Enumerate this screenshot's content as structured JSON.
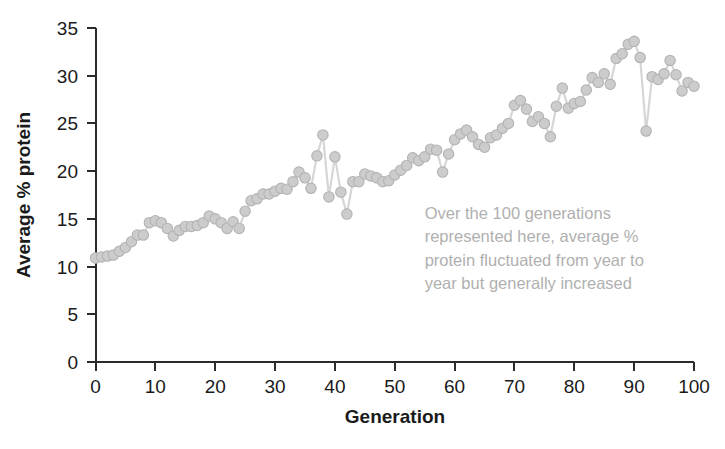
{
  "chart_data": {
    "type": "scatter",
    "title": "",
    "xlabel": "Generation",
    "ylabel": "Average % protein",
    "xlim": [
      0,
      100
    ],
    "ylim": [
      0,
      35
    ],
    "xticks": [
      0,
      10,
      20,
      30,
      40,
      50,
      60,
      70,
      80,
      90,
      100
    ],
    "yticks": [
      0,
      5,
      10,
      15,
      20,
      25,
      30,
      35
    ],
    "grid": false,
    "legend": null,
    "marker_style": "filled-circle-gray-connected-by-line",
    "annotations": [
      {
        "text": "Over the 100 generations represented here, average % protein fluctuated from year to year but generally increased",
        "lines": [
          "Over the 100 generations",
          "represented here, average %",
          "protein fluctuated from year to",
          "year but generally increased"
        ],
        "x": 55,
        "y": 15,
        "color": "#b0b0b0"
      }
    ],
    "series": [
      {
        "name": "Average % protein",
        "x": [
          0,
          1,
          2,
          3,
          4,
          5,
          6,
          7,
          8,
          9,
          10,
          11,
          12,
          13,
          14,
          15,
          16,
          17,
          18,
          19,
          20,
          21,
          22,
          23,
          24,
          25,
          26,
          27,
          28,
          29,
          30,
          31,
          32,
          33,
          34,
          35,
          36,
          37,
          38,
          39,
          40,
          41,
          42,
          43,
          44,
          45,
          46,
          47,
          48,
          49,
          50,
          51,
          52,
          53,
          54,
          55,
          56,
          57,
          58,
          59,
          60,
          61,
          62,
          63,
          64,
          65,
          66,
          67,
          68,
          69,
          70,
          71,
          72,
          73,
          74,
          75,
          76,
          77,
          78,
          79,
          80,
          81,
          82,
          83,
          84,
          85,
          86,
          87,
          88,
          89,
          90,
          91,
          92,
          93,
          94,
          95,
          96,
          97,
          98,
          99,
          100
        ],
        "values": [
          10.9,
          11.0,
          11.1,
          11.2,
          11.6,
          12.0,
          12.6,
          13.3,
          13.3,
          14.6,
          14.8,
          14.6,
          14.0,
          13.2,
          13.8,
          14.2,
          14.2,
          14.3,
          14.6,
          15.3,
          15.0,
          14.6,
          14.0,
          14.7,
          14.0,
          15.8,
          16.9,
          17.1,
          17.6,
          17.6,
          17.9,
          18.2,
          18.1,
          18.9,
          19.9,
          19.3,
          18.2,
          21.6,
          23.8,
          17.3,
          21.5,
          17.8,
          15.5,
          18.9,
          18.9,
          19.7,
          19.5,
          19.3,
          18.9,
          19.0,
          19.6,
          20.1,
          20.6,
          21.4,
          21.1,
          21.5,
          22.3,
          22.2,
          19.9,
          21.8,
          23.3,
          23.9,
          24.3,
          23.6,
          22.8,
          22.5,
          23.5,
          23.8,
          24.5,
          25.0,
          26.9,
          27.4,
          26.5,
          25.2,
          25.7,
          25.0,
          23.6,
          26.8,
          28.7,
          26.6,
          27.1,
          27.3,
          28.5,
          29.8,
          29.3,
          30.2,
          29.1,
          31.8,
          32.3,
          33.3,
          33.6,
          31.9,
          24.2,
          29.9,
          29.6,
          30.2,
          31.6,
          30.1,
          28.4,
          29.3,
          28.9
        ]
      }
    ]
  },
  "axis": {
    "y_label": "Average % protein",
    "x_label": "Generation"
  }
}
